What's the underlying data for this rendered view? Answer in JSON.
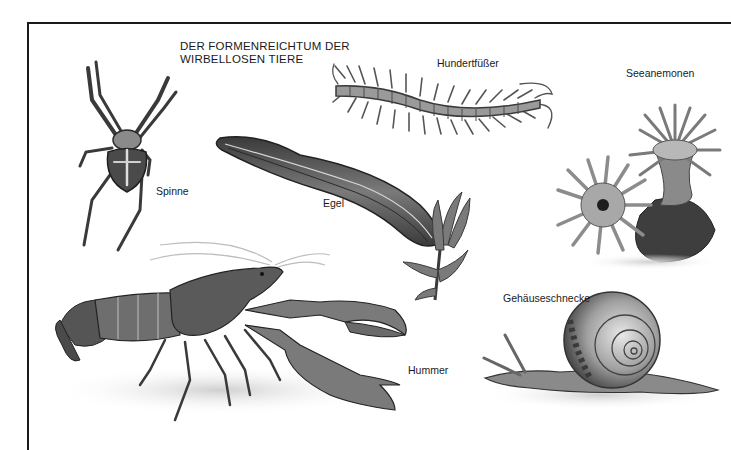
{
  "plate": {
    "title_line1": "DER FORMENREICHTUM DER",
    "title_line2": "WIRBELLOSEN TIERE"
  },
  "animals": [
    {
      "id": "spider",
      "label": "Spinne"
    },
    {
      "id": "leech",
      "label": "Egel"
    },
    {
      "id": "centipede",
      "label": "Hundertfüßer"
    },
    {
      "id": "sea-anemones",
      "label": "Seeanemonen"
    },
    {
      "id": "lobster",
      "label": "Hummer"
    },
    {
      "id": "snail",
      "label": "Gehäuseschnecke"
    }
  ],
  "colors": {
    "frame": "#1a1a1a",
    "ink_dark": "#2b2b2b",
    "ink_mid": "#6e6e6e",
    "ink_light": "#a8a8a8",
    "ground": "#d9d9d9"
  }
}
